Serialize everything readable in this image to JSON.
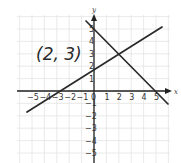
{
  "diagram": {
    "annotation": "(2, 3)",
    "axes": {
      "x_label": "x",
      "y_label": "y",
      "x_ticks": [
        "−5",
        "−4",
        "−3",
        "−2",
        "−1",
        "0",
        "1",
        "2",
        "3",
        "4",
        "5"
      ],
      "y_ticks": [
        "5",
        "4",
        "3",
        "2",
        "1",
        "−1",
        "−2",
        "−3",
        "−4",
        "−5"
      ]
    },
    "lines": [
      {
        "name": "line-increasing",
        "equation": "y = 0.6x + 1.8",
        "through": [
          [
            -3,
            0
          ],
          [
            2,
            3
          ]
        ]
      },
      {
        "name": "line-decreasing",
        "equation": "y = -x + 5",
        "through": [
          [
            0,
            5
          ],
          [
            2,
            3
          ],
          [
            5,
            0
          ]
        ]
      }
    ],
    "intersection": [
      2,
      3
    ]
  }
}
